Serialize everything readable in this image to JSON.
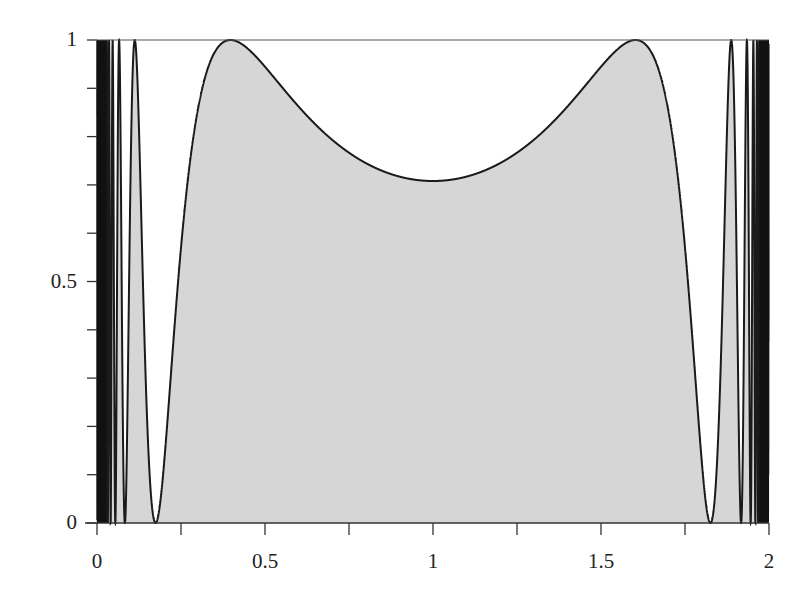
{
  "chart_data": {
    "type": "area",
    "title": "",
    "xlabel": "",
    "ylabel": "",
    "function_description": "f(x) = sin^2(1 / (x(2 - x))), filled under curve",
    "xlim": [
      0,
      2
    ],
    "ylim": [
      0,
      1
    ],
    "grid": false,
    "legend": null,
    "x_tick_labels": [
      "0",
      "0.5",
      "1",
      "1.5",
      "2"
    ],
    "x_tick_values": [
      0,
      0.5,
      1,
      1.5,
      2
    ],
    "x_minor_ticks": [
      0.25,
      0.75,
      1.25,
      1.75
    ],
    "y_tick_labels": [
      "0",
      "0.5",
      "1"
    ],
    "y_tick_values": [
      0,
      0.5,
      1
    ],
    "y_minor_ticks": [
      0.1,
      0.2,
      0.3,
      0.4,
      0.6,
      0.7,
      0.8,
      0.9
    ],
    "fill_color": "#d6d6d6",
    "line_color": "#1a1a1a",
    "series": [
      {
        "name": "f(x)",
        "x": [
          0.11,
          0.173,
          0.25,
          0.3,
          0.4,
          0.5,
          0.6,
          0.7,
          0.8,
          0.9,
          1.0,
          1.1,
          1.2,
          1.3,
          1.4,
          1.5,
          1.6,
          1.7,
          1.75,
          1.827,
          1.89
        ],
        "values": [
          1.0,
          0.0,
          0.45,
          0.85,
          1.0,
          0.96,
          0.88,
          0.81,
          0.76,
          0.72,
          0.71,
          0.72,
          0.76,
          0.81,
          0.88,
          0.96,
          1.0,
          0.85,
          0.45,
          0.0,
          1.0
        ]
      }
    ],
    "annotations": [
      "rapid oscillations near x=0 and x=2"
    ]
  }
}
